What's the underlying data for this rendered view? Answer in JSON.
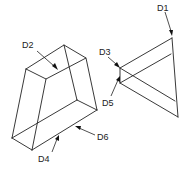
{
  "figure": {
    "line_color": "#222222",
    "background": "#ffffff",
    "left_block": {
      "name": "tapered block",
      "labels": [
        "D2",
        "D4",
        "D6"
      ]
    },
    "right_block": {
      "name": "triangular wedge",
      "labels": [
        "D1",
        "D3",
        "D5"
      ]
    },
    "labels": {
      "d1": "D1",
      "d2": "D2",
      "d3": "D3",
      "d4": "D4",
      "d5": "D5",
      "d6": "D6"
    }
  }
}
